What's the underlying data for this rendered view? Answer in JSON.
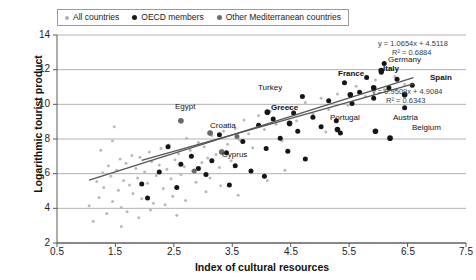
{
  "chart_data": {
    "type": "scatter",
    "title": "",
    "xlabel": "Index of cultural resources",
    "ylabel": "Logarithmic tourist product",
    "xlim": [
      0.5,
      7.5
    ],
    "ylim": [
      2,
      14
    ],
    "xticks": [
      "0.5",
      "1.5",
      "2.5",
      "3.5",
      "4.5",
      "5.5",
      "6.5",
      "7.5"
    ],
    "yticks": [
      "2",
      "4",
      "6",
      "8",
      "10",
      "12",
      "14"
    ],
    "grid": true,
    "legend_position": "top-left",
    "legend": [
      {
        "label": "All countries",
        "color": "#b0b0b0",
        "marker": "small-dot"
      },
      {
        "label": "OECD members",
        "color": "#1a1a1a",
        "marker": "dot"
      },
      {
        "label": "Other Mediterranean countries",
        "color": "#6e6e6e",
        "marker": "dot"
      }
    ],
    "annotations": [
      {
        "name": "all-countries-fit",
        "text_eq": "y = 1.0654x + 4.5118",
        "text_r2": "R² = 0.6884",
        "slope": 1.0654,
        "intercept": 4.5118,
        "r2": 0.6884
      },
      {
        "name": "oecd-fit",
        "text_eq": "y = 0.9509x + 4.9084",
        "text_r2": "R² = 0.6343",
        "slope": 0.9509,
        "intercept": 4.9084,
        "r2": 0.6343
      }
    ],
    "series": [
      {
        "name": "All countries",
        "color": "#b9b9b9",
        "points": [
          [
            1.05,
            4.15
          ],
          [
            1.12,
            3.25
          ],
          [
            1.18,
            5.55
          ],
          [
            1.22,
            4.62
          ],
          [
            1.28,
            6.05
          ],
          [
            1.3,
            5.2
          ],
          [
            1.35,
            3.7
          ],
          [
            1.38,
            6.45
          ],
          [
            1.42,
            5.85
          ],
          [
            1.45,
            4.4
          ],
          [
            1.48,
            8.7
          ],
          [
            1.52,
            6.2
          ],
          [
            1.55,
            5.05
          ],
          [
            1.58,
            6.85
          ],
          [
            1.6,
            4.05
          ],
          [
            1.64,
            5.6
          ],
          [
            1.68,
            6.6
          ],
          [
            1.7,
            3.8
          ],
          [
            1.74,
            5.35
          ],
          [
            1.78,
            7.05
          ],
          [
            1.8,
            4.85
          ],
          [
            1.85,
            6.3
          ],
          [
            1.88,
            5.75
          ],
          [
            1.92,
            6.95
          ],
          [
            1.95,
            4.55
          ],
          [
            2.0,
            6.1
          ],
          [
            2.05,
            5.45
          ],
          [
            2.08,
            7.25
          ],
          [
            2.12,
            6.7
          ],
          [
            2.15,
            4.3
          ],
          [
            2.2,
            5.9
          ],
          [
            2.25,
            6.5
          ],
          [
            2.28,
            7.45
          ],
          [
            2.32,
            5.15
          ],
          [
            2.38,
            6.25
          ],
          [
            2.42,
            7.65
          ],
          [
            2.45,
            5.7
          ],
          [
            2.48,
            4.7
          ],
          [
            2.52,
            6.8
          ],
          [
            2.58,
            7.15
          ],
          [
            2.62,
            5.95
          ],
          [
            2.68,
            6.4
          ],
          [
            2.72,
            8.05
          ],
          [
            2.78,
            7.35
          ],
          [
            2.82,
            6.15
          ],
          [
            2.88,
            5.5
          ],
          [
            2.92,
            7.8
          ],
          [
            2.98,
            6.65
          ],
          [
            3.02,
            7.55
          ],
          [
            3.08,
            6.9
          ],
          [
            3.15,
            8.2
          ],
          [
            3.22,
            7.1
          ],
          [
            3.28,
            6.35
          ],
          [
            3.35,
            8.45
          ],
          [
            3.42,
            7.7
          ],
          [
            3.48,
            6.75
          ],
          [
            3.55,
            8.6
          ],
          [
            3.62,
            7.95
          ],
          [
            3.7,
            9.1
          ],
          [
            3.78,
            8.3
          ],
          [
            3.85,
            7.5
          ],
          [
            3.95,
            9.35
          ],
          [
            4.05,
            8.55
          ],
          [
            4.15,
            9.6
          ],
          [
            4.25,
            8.85
          ],
          [
            4.35,
            7.9
          ],
          [
            4.48,
            9.8
          ],
          [
            4.6,
            9.05
          ],
          [
            4.75,
            10.1
          ],
          [
            4.88,
            9.45
          ],
          [
            5.02,
            10.35
          ],
          [
            5.15,
            9.7
          ],
          [
            5.3,
            10.6
          ],
          [
            5.48,
            9.95
          ],
          [
            5.62,
            11.05
          ],
          [
            5.78,
            10.45
          ],
          [
            5.95,
            11.4
          ],
          [
            6.1,
            10.85
          ],
          [
            6.28,
            11.6
          ],
          [
            6.45,
            11.15
          ],
          [
            1.6,
            2.95
          ],
          [
            1.9,
            3.45
          ],
          [
            2.1,
            3.9
          ],
          [
            2.35,
            4.2
          ],
          [
            2.55,
            3.6
          ],
          [
            3.05,
            4.95
          ],
          [
            3.3,
            5.3
          ],
          [
            3.6,
            4.75
          ],
          [
            4.1,
            5.6
          ],
          [
            4.4,
            6.2
          ],
          [
            1.25,
            7.35
          ],
          [
            1.45,
            7.9
          ],
          [
            2.7,
            4.45
          ],
          [
            3.12,
            5.75
          ],
          [
            5.1,
            8.4
          ]
        ]
      },
      {
        "name": "OECD members",
        "color": "#151515",
        "points": [
          [
            1.95,
            5.4
          ],
          [
            2.25,
            6.1
          ],
          [
            2.4,
            7.55
          ],
          [
            2.55,
            5.2
          ],
          [
            2.62,
            6.55
          ],
          [
            2.8,
            7.0
          ],
          [
            2.92,
            6.3
          ],
          [
            3.05,
            5.95
          ],
          [
            3.15,
            6.75
          ],
          [
            3.28,
            8.25
          ],
          [
            3.4,
            7.2
          ],
          [
            3.55,
            6.45
          ],
          [
            3.68,
            7.85
          ],
          [
            3.82,
            6.15
          ],
          [
            3.95,
            8.8
          ],
          [
            4.08,
            7.45
          ],
          [
            4.2,
            9.15
          ],
          [
            4.32,
            8.05
          ],
          [
            4.45,
            7.3
          ],
          [
            4.55,
            9.5
          ],
          [
            4.62,
            8.45
          ],
          [
            4.75,
            6.85
          ],
          [
            4.88,
            9.25
          ],
          [
            5.02,
            8.7
          ],
          [
            5.15,
            10.2
          ],
          [
            5.28,
            9.05
          ],
          [
            5.42,
            11.25
          ],
          [
            5.55,
            10.05
          ],
          [
            5.68,
            10.7
          ],
          [
            5.8,
            11.55
          ],
          [
            5.92,
            10.35
          ],
          [
            6.05,
            11.85
          ],
          [
            6.18,
            10.95
          ],
          [
            6.32,
            11.45
          ],
          [
            6.45,
            9.8
          ],
          [
            6.58,
            11.1
          ],
          [
            4.05,
            5.85
          ],
          [
            3.45,
            5.35
          ],
          [
            2.05,
            4.6
          ],
          [
            5.35,
            8.35
          ],
          [
            6.1,
            12.35
          ],
          [
            4.7,
            10.45
          ]
        ]
      },
      {
        "name": "Other Mediterranean countries",
        "color": "#6a6a6a",
        "points": [
          [
            2.62,
            9.05
          ],
          [
            3.12,
            8.35
          ],
          [
            3.32,
            7.25
          ],
          [
            2.85,
            6.15
          ],
          [
            3.58,
            8.15
          ]
        ]
      }
    ],
    "labeled_points": [
      {
        "label": "Egypt",
        "series": "Other Mediterranean countries",
        "x": 2.62,
        "y": 9.05,
        "bold": false
      },
      {
        "label": "Croatia",
        "series": "Other Mediterranean countries",
        "x": 3.12,
        "y": 8.35,
        "bold": false
      },
      {
        "label": "Cyprus",
        "series": "Other Mediterranean countries",
        "x": 3.32,
        "y": 7.25,
        "bold": false
      },
      {
        "label": "Turkey",
        "series": "OECD members",
        "x": 4.1,
        "y": 9.55,
        "bold": false
      },
      {
        "label": "Greece",
        "series": "OECD members",
        "x": 4.48,
        "y": 8.9,
        "bold": true
      },
      {
        "label": "Portugal",
        "series": "OECD members",
        "x": 5.3,
        "y": 8.55,
        "bold": false
      },
      {
        "label": "Austria",
        "series": "OECD members",
        "x": 5.95,
        "y": 8.45,
        "bold": false
      },
      {
        "label": "Belgium",
        "series": "OECD members",
        "x": 6.2,
        "y": 8.05,
        "bold": false
      },
      {
        "label": "France",
        "series": "OECD members",
        "x": 5.52,
        "y": 10.55,
        "bold": true
      },
      {
        "label": "Italy",
        "series": "OECD members",
        "x": 5.92,
        "y": 10.95,
        "bold": true
      },
      {
        "label": "Germany",
        "series": "OECD members",
        "x": 6.05,
        "y": 11.95,
        "bold": false
      },
      {
        "label": "Spain",
        "series": "OECD members",
        "x": 6.45,
        "y": 10.55,
        "bold": true
      }
    ]
  }
}
